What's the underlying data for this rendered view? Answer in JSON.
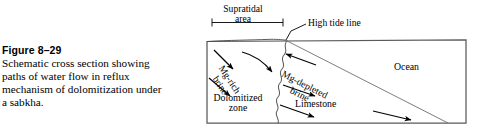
{
  "caption": {
    "title": "Figure 8–29",
    "lines": [
      "Schematic cross section showing",
      "paths of water flow in reflux",
      "mechanism of dolomitization under",
      "a sabkha."
    ]
  },
  "figure": {
    "supratidal": {
      "line1": "Supratidal",
      "line2": "area"
    },
    "high_tide_line": "High tide line",
    "ocean": "Ocean",
    "limestone": "Limestone",
    "dolomitized_zone": {
      "line1": "Dolomitized",
      "line2": "zone"
    },
    "mg_rich_brine": {
      "line1": "Mg-rich",
      "line2": "brine"
    },
    "mg_depleted_brine": {
      "line1": "Mg-depleted",
      "line2": "brine"
    },
    "colors": {
      "ink": "#000000",
      "box_stroke": "#5a5a5a",
      "hairline": "#6e6e6e",
      "background": "#ffffff"
    }
  }
}
